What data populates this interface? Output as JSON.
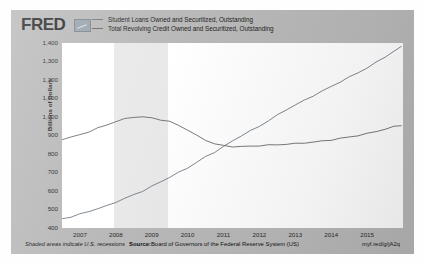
{
  "brand": {
    "logo_text": "FRED",
    "mark_name": "fred-graph-mark"
  },
  "legend": [
    {
      "label": "Student Loans Owned and Securitized, Outstanding",
      "color": "#6f7b86"
    },
    {
      "label": "Total Revolving Credit Owned and Securitized, Outstanding",
      "color": "#6a6a6a"
    }
  ],
  "footer": {
    "recession_note": "Shaded areas indicate U.S. recessions",
    "source_prefix": "Source:",
    "source_text": "Board of Governors of the Federal Reserve System (US)",
    "permalink": "myf.red/g/jA2q"
  },
  "chart_data": {
    "type": "line",
    "title": "",
    "xlabel": "",
    "ylabel": "Billions of Dollars",
    "ylim": [
      400,
      1400
    ],
    "yticks": [
      1400,
      1300,
      1200,
      1100,
      1000,
      900,
      800,
      700,
      600,
      500,
      400
    ],
    "ytick_labels": [
      "1,400",
      "1,300",
      "1,200",
      "1,100",
      "1,000",
      "900",
      "800",
      "700",
      "600",
      "500",
      "400"
    ],
    "xlim": [
      2006.5,
      2016.0
    ],
    "xticks": [
      2007,
      2008,
      2009,
      2010,
      2011,
      2012,
      2013,
      2014,
      2015
    ],
    "xtick_labels": [
      "2007",
      "2008",
      "2009",
      "2010",
      "2011",
      "2012",
      "2013",
      "2014",
      "2015"
    ],
    "grid": false,
    "legend_position": "top",
    "shaded_regions": [
      {
        "name": "recession-2007-2009",
        "start": 2007.95,
        "end": 2009.45,
        "color": "#e9e9e9"
      }
    ],
    "series": [
      {
        "name": "Student Loans Owned and Securitized, Outstanding",
        "color": "#6f7b86",
        "x": [
          2006.5,
          2006.75,
          2007.0,
          2007.25,
          2007.5,
          2007.75,
          2008.0,
          2008.25,
          2008.5,
          2008.75,
          2009.0,
          2009.25,
          2009.5,
          2009.75,
          2010.0,
          2010.25,
          2010.5,
          2010.75,
          2011.0,
          2011.25,
          2011.5,
          2011.75,
          2012.0,
          2012.25,
          2012.5,
          2012.75,
          2013.0,
          2013.25,
          2013.5,
          2013.75,
          2014.0,
          2014.25,
          2014.5,
          2014.75,
          2015.0,
          2015.25,
          2015.5,
          2015.75,
          2015.95
        ],
        "values": [
          450,
          460,
          475,
          490,
          505,
          520,
          540,
          560,
          580,
          600,
          625,
          650,
          675,
          700,
          725,
          755,
          785,
          810,
          840,
          870,
          900,
          925,
          950,
          980,
          1010,
          1040,
          1065,
          1090,
          1115,
          1140,
          1165,
          1190,
          1215,
          1240,
          1265,
          1295,
          1325,
          1355,
          1380
        ]
      },
      {
        "name": "Total Revolving Credit Owned and Securitized, Outstanding",
        "color": "#6a6a6a",
        "x": [
          2006.5,
          2006.75,
          2007.0,
          2007.25,
          2007.5,
          2007.75,
          2008.0,
          2008.25,
          2008.5,
          2008.75,
          2009.0,
          2009.25,
          2009.5,
          2009.75,
          2010.0,
          2010.25,
          2010.5,
          2010.75,
          2011.0,
          2011.25,
          2011.5,
          2011.75,
          2012.0,
          2012.25,
          2012.5,
          2012.75,
          2013.0,
          2013.25,
          2013.5,
          2013.75,
          2014.0,
          2014.25,
          2014.5,
          2014.75,
          2015.0,
          2015.25,
          2015.5,
          2015.75,
          2015.95
        ],
        "values": [
          880,
          890,
          905,
          920,
          940,
          958,
          975,
          990,
          1000,
          1000,
          995,
          985,
          975,
          955,
          930,
          900,
          875,
          855,
          845,
          840,
          840,
          842,
          845,
          848,
          850,
          853,
          856,
          860,
          864,
          870,
          876,
          884,
          892,
          900,
          910,
          922,
          934,
          948,
          955
        ]
      }
    ]
  }
}
